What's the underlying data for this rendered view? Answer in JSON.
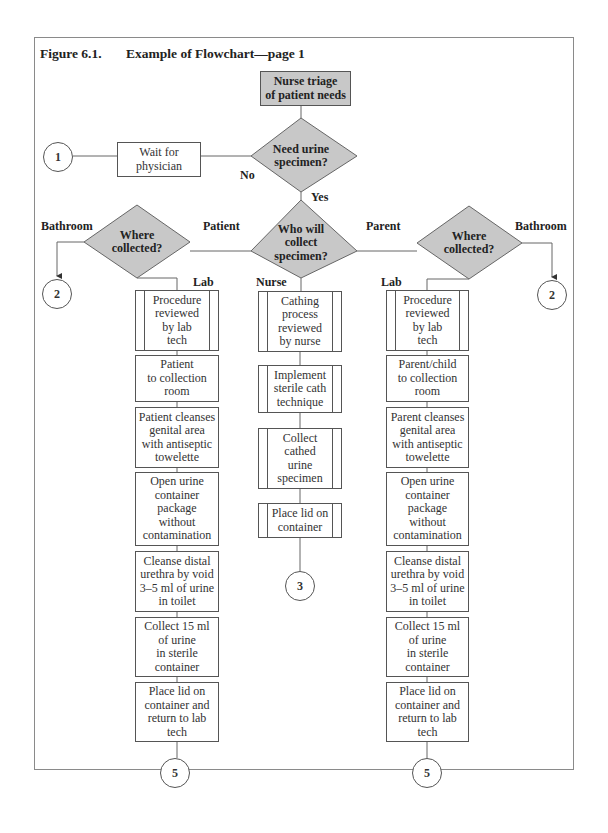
{
  "figure": {
    "number": "Figure 6.1.",
    "title": "Example of Flowchart—page 1"
  },
  "nodes": {
    "start": "Nurse triage\nof patient needs",
    "decision_need": "Need urine\nspecimen?",
    "wait": "Wait for\nphysician",
    "decision_who": "Who will\ncollect\nspecimen?",
    "decision_where_left": "Where\ncollected?",
    "decision_where_right": "Where\ncollected?"
  },
  "connectors": {
    "c1": "1",
    "c2_left": "2",
    "c2_right": "2",
    "c3": "3",
    "c5_left": "5",
    "c5_right": "5"
  },
  "edge_labels": {
    "no": "No",
    "yes": "Yes",
    "patient": "Patient",
    "parent": "Parent",
    "nurse": "Nurse",
    "bathroom_left": "Bathroom",
    "bathroom_right": "Bathroom",
    "lab_left": "Lab",
    "lab_right": "Lab"
  },
  "patient_column": [
    "Procedure\nreviewed\nby lab\ntech",
    "Patient\nto collection\nroom",
    "Patient cleanses\ngenital area\nwith antiseptic\ntowelette",
    "Open urine\ncontainer\npackage\nwithout\ncontamination",
    "Cleanse distal\nurethra by void\n3–5 ml of urine\nin toilet",
    "Collect 15 ml\nof urine\nin sterile\ncontainer",
    "Place lid on\ncontainer and\nreturn to lab\ntech"
  ],
  "nurse_column": [
    "Cathing\nprocess\nreviewed\nby nurse",
    "Implement\nsterile cath\ntechnique",
    "Collect\ncathed\nurine\nspecimen",
    "Place lid on\ncontainer"
  ],
  "parent_column": [
    "Procedure\nreviewed\nby lab\ntech",
    "Parent/child\nto collection\nroom",
    "Parent cleanses\ngenital area\nwith antiseptic\ntowelette",
    "Open urine\ncontainer\npackage\nwithout\ncontamination",
    "Cleanse distal\nurethra by void\n3–5 ml of urine\nin toilet",
    "Collect 15 ml\nof urine\nin sterile\ncontainer",
    "Place lid on\ncontainer and\nreturn to lab\ntech"
  ],
  "colors": {
    "decision_fill": "#c8c8c8",
    "start_fill": "#c8c8c8",
    "line": "#555555"
  }
}
